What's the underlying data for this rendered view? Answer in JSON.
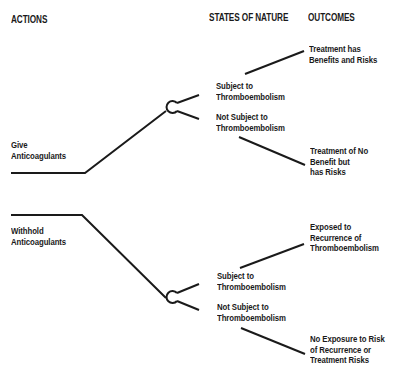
{
  "headers": {
    "actions": "ACTIONS",
    "states_of_nature": "STATES OF NATURE",
    "outcomes": "OUTCOMES"
  },
  "actions": [
    {
      "label_lines": [
        "Give",
        "Anticoagulants"
      ],
      "states": [
        {
          "label_lines": [
            "Subject to",
            "Thromboembolism"
          ],
          "outcome_lines": [
            "Treatment has",
            "Benefits and Risks"
          ]
        },
        {
          "label_lines": [
            "Not Subject to",
            "Thromboembolism"
          ],
          "outcome_lines": [
            "Treatment of No",
            "Benefit but",
            "has Risks"
          ]
        }
      ]
    },
    {
      "label_lines": [
        "Withhold",
        "Anticoagulants"
      ],
      "states": [
        {
          "label_lines": [
            "Subject to",
            "Thromboembolism"
          ],
          "outcome_lines": [
            "Exposed to",
            "Recurrence of",
            "Thromboembolism"
          ]
        },
        {
          "label_lines": [
            "Not Subject to",
            "Thromboembolism"
          ],
          "outcome_lines": [
            "No Exposure to Risk",
            "of Recurrence or",
            "Treatment Risks"
          ]
        }
      ]
    }
  ],
  "colors": {
    "line": "#1a1a1a",
    "background": "#ffffff"
  }
}
